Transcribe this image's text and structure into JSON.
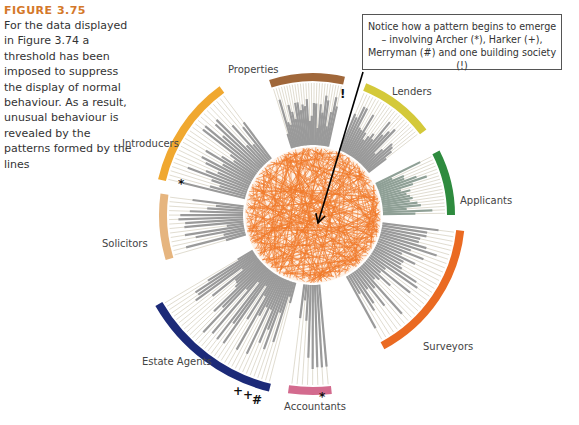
{
  "figure": {
    "title": "FIGURE 3.75",
    "caption": "For the data displayed in Figure 3.74 a threshold has been imposed to suppress the display of normal behaviour. As a result, unusual behaviour is revealed by the patterns formed by the lines",
    "callout": "Notice how a pattern begins to emerge – involving Archer (*), Harker (+), Merryman (#) and one building society (!)"
  },
  "chart_data": {
    "type": "radial-network",
    "center": [
      313,
      215
    ],
    "hub_radius": 68,
    "hub_color": "#f07a2a",
    "segments": [
      {
        "name": "Properties",
        "color": "#a0673a",
        "start": -108,
        "end": -77,
        "inner": 70,
        "outer": 138,
        "label_x": 228,
        "label_y": 74,
        "bars": 26
      },
      {
        "name": "Lenders",
        "color": "#d4c93a",
        "start": -68,
        "end": -37,
        "inner": 70,
        "outer": 138,
        "label_x": 392,
        "label_y": 96,
        "bars": 22
      },
      {
        "name": "Applicants",
        "color": "#2e8b3e",
        "start": -27,
        "end": 0,
        "inner": 70,
        "outer": 138,
        "label_x": 460,
        "label_y": 205,
        "bars": 18
      },
      {
        "name": "Surveyors",
        "color": "#ea6a22",
        "start": 6,
        "end": 62,
        "inner": 70,
        "outer": 148,
        "label_x": 423,
        "label_y": 351,
        "bars": 30
      },
      {
        "name": "Accountants",
        "color": "#d36b8e",
        "start": 84,
        "end": 98,
        "inner": 70,
        "outer": 176,
        "label_x": 284,
        "label_y": 411,
        "bars": 8
      },
      {
        "name": "Estate Agents",
        "color": "#1c2a78",
        "start": 104,
        "end": 150,
        "inner": 70,
        "outer": 178,
        "label_x": 142,
        "label_y": 366,
        "bars": 34
      },
      {
        "name": "Solicitors",
        "color": "#e6b57f",
        "start": 163,
        "end": 188,
        "inner": 70,
        "outer": 150,
        "label_x": 102,
        "label_y": 248,
        "bars": 14
      },
      {
        "name": "Introducers",
        "color": "#f0a830",
        "start": 193,
        "end": 234,
        "inner": 70,
        "outer": 155,
        "label_x": 122,
        "label_y": 148,
        "bars": 24
      }
    ],
    "markers": [
      {
        "symbol": "*",
        "meaning": "Archer",
        "x": 182,
        "y": 186
      },
      {
        "symbol": "*",
        "meaning": "Archer",
        "x": 323,
        "y": 399
      },
      {
        "symbol": "+",
        "meaning": "Harker",
        "x": 237,
        "y": 393
      },
      {
        "symbol": "+",
        "meaning": "Harker",
        "x": 247,
        "y": 397
      },
      {
        "symbol": "#",
        "meaning": "Merryman",
        "x": 256,
        "y": 402
      },
      {
        "symbol": "!",
        "meaning": "building society",
        "x": 344,
        "y": 96
      }
    ],
    "arrow": {
      "from": [
        363,
        72
      ],
      "to": [
        318,
        223
      ]
    }
  }
}
